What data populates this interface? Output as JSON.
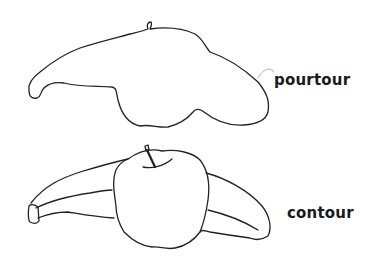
{
  "figure": {
    "panels": [
      {
        "id": "top",
        "description": "silhouette outline of banana and apple combined",
        "label": "pourtour"
      },
      {
        "id": "bottom",
        "description": "line drawing of apple overlapping banana with internal edges",
        "label": "contour"
      }
    ]
  },
  "colors": {
    "line": "#222222",
    "text": "#1a1a1a",
    "background": "#ffffff"
  }
}
